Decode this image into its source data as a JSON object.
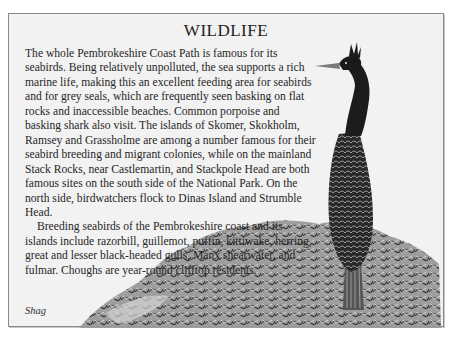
{
  "page": {
    "title": "WILDLIFE",
    "paragraphs": [
      "The whole Pembrokeshire Coast Path is famous for its seabirds. Being relatively unpolluted, the sea supports a rich marine life, making this an excellent feeding area for seabirds and for grey seals, which are frequently seen basking on flat rocks and inaccessible beaches. Common porpoise and basking shark also visit. The islands of Skomer, Skokholm, Ramsey and Grassholme are among a number famous for their seabird breeding and migrant colonies, while on the mainland Stack Rocks, near Castlemartin, and Stackpole Head are both famous sites on the south side of the National Park. On the north side, birdwatchers flock to Dinas Island and Strumble Head.",
      "Breeding seabirds of the Pembrokeshire coast and its islands include razorbill, guillemot, puffin, kittiwake, herring, great and lesser black-headed gulls, Manx shearwater, and fulmar. Choughs are year-round clifftop residents."
    ],
    "illustration": {
      "subject": "shag-bird-on-rocks-icon",
      "caption": "Shag"
    },
    "colors": {
      "panel_background": "#f2f2f2",
      "border": "#8a8a8a",
      "text": "#262626"
    }
  }
}
